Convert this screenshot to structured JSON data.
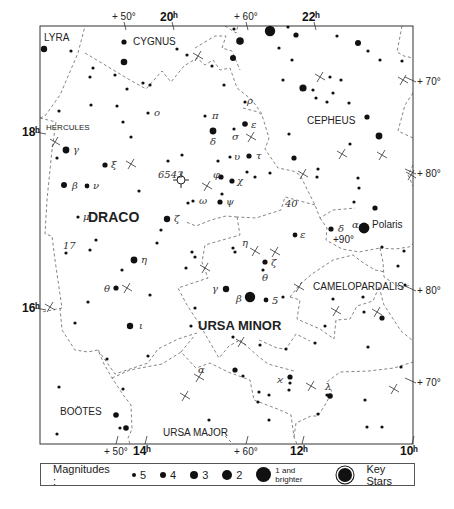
{
  "frame": {
    "x": 40,
    "y": 26,
    "w": 373,
    "h": 418
  },
  "constellations": [
    {
      "name": "LYRA",
      "x": 44,
      "y": 41,
      "size": 10
    },
    {
      "name": "CYGNUS",
      "x": 133,
      "y": 45,
      "size": 10
    },
    {
      "name": "HERCULES",
      "x": 46,
      "y": 130,
      "size": 8
    },
    {
      "name": "CEPHEUS",
      "x": 307,
      "y": 124,
      "size": 10
    },
    {
      "name": "DRACO",
      "x": 88,
      "y": 222,
      "size": 14,
      "bold": true
    },
    {
      "name": "URSA MINOR",
      "x": 198,
      "y": 330,
      "size": 13,
      "bold": true
    },
    {
      "name": "CAMELOPARDALIS",
      "x": 313,
      "y": 290,
      "size": 10
    },
    {
      "name": "BOÖTES",
      "x": 60,
      "y": 415,
      "size": 10
    },
    {
      "name": "URSA MAJOR",
      "x": 163,
      "y": 436,
      "size": 10
    }
  ],
  "coordinates": {
    "top": [
      {
        "label": "+ 50°",
        "x": 112,
        "y": 20,
        "bold": false
      },
      {
        "label": "20ʰ",
        "x": 160,
        "y": 21,
        "bold": true
      },
      {
        "label": "+ 60°",
        "x": 234,
        "y": 20,
        "bold": false
      },
      {
        "label": "22ʰ",
        "x": 302,
        "y": 21,
        "bold": true
      }
    ],
    "bottom": [
      {
        "label": "+ 50°",
        "x": 104,
        "y": 455,
        "bold": false
      },
      {
        "label": "14ʰ",
        "x": 133,
        "y": 455,
        "bold": true
      },
      {
        "label": "+ 60°",
        "x": 234,
        "y": 455,
        "bold": false
      },
      {
        "label": "12ʰ",
        "x": 290,
        "y": 455,
        "bold": true
      },
      {
        "label": "10ʰ",
        "x": 400,
        "y": 455,
        "bold": true
      }
    ],
    "left": [
      {
        "label": "18ʰ",
        "x": 22,
        "y": 136,
        "bold": true
      },
      {
        "label": "16ʰ",
        "x": 22,
        "y": 312,
        "bold": true
      }
    ],
    "right": [
      {
        "label": "+ 70°",
        "x": 417,
        "y": 85
      },
      {
        "label": "+ 80°",
        "x": 417,
        "y": 177
      },
      {
        "label": "+ 80°",
        "x": 417,
        "y": 294
      },
      {
        "label": "+ 70°",
        "x": 417,
        "y": 386
      }
    ]
  },
  "stars": [
    {
      "x": 44,
      "y": 49,
      "r": 3.2
    },
    {
      "x": 71,
      "y": 51,
      "r": 1.6
    },
    {
      "x": 124,
      "y": 42,
      "r": 2.6
    },
    {
      "x": 124,
      "y": 62,
      "r": 3.3
    },
    {
      "x": 93,
      "y": 68,
      "r": 1.6
    },
    {
      "x": 90,
      "y": 77,
      "r": 1.6
    },
    {
      "x": 115,
      "y": 75,
      "r": 1.6
    },
    {
      "x": 127,
      "y": 89,
      "r": 1.6
    },
    {
      "x": 143,
      "y": 83,
      "r": 1.6
    },
    {
      "x": 150,
      "y": 85,
      "r": 1.6
    },
    {
      "x": 177,
      "y": 49,
      "r": 1.6
    },
    {
      "x": 187,
      "y": 55,
      "r": 1.6
    },
    {
      "x": 212,
      "y": 66,
      "r": 1.6
    },
    {
      "x": 224,
      "y": 85,
      "r": 1.6
    },
    {
      "x": 59,
      "y": 111,
      "r": 1.6
    },
    {
      "x": 91,
      "y": 105,
      "r": 1.6
    },
    {
      "x": 117,
      "y": 106,
      "r": 1.6
    },
    {
      "x": 148,
      "y": 113,
      "r": 1.6
    },
    {
      "x": 123,
      "y": 122,
      "r": 1.6
    },
    {
      "x": 131,
      "y": 137,
      "r": 1.6
    },
    {
      "x": 240,
      "y": 41,
      "r": 3.8
    },
    {
      "x": 270,
      "y": 31,
      "r": 5.2
    },
    {
      "x": 233,
      "y": 58,
      "r": 3.0
    },
    {
      "x": 288,
      "y": 27,
      "r": 1.6
    },
    {
      "x": 296,
      "y": 35,
      "r": 2.6
    },
    {
      "x": 337,
      "y": 36,
      "r": 1.6
    },
    {
      "x": 279,
      "y": 48,
      "r": 1.6
    },
    {
      "x": 292,
      "y": 60,
      "r": 1.6
    },
    {
      "x": 358,
      "y": 43,
      "r": 3.0
    },
    {
      "x": 368,
      "y": 51,
      "r": 1.6
    },
    {
      "x": 380,
      "y": 60,
      "r": 1.6
    },
    {
      "x": 402,
      "y": 61,
      "r": 1.6
    },
    {
      "x": 283,
      "y": 80,
      "r": 1.6
    },
    {
      "x": 303,
      "y": 88,
      "r": 3.6
    },
    {
      "x": 330,
      "y": 77,
      "r": 1.6
    },
    {
      "x": 341,
      "y": 80,
      "r": 1.6
    },
    {
      "x": 313,
      "y": 90,
      "r": 1.6
    },
    {
      "x": 333,
      "y": 93,
      "r": 1.6
    },
    {
      "x": 316,
      "y": 98,
      "r": 1.6
    },
    {
      "x": 327,
      "y": 102,
      "r": 1.6
    },
    {
      "x": 349,
      "y": 103,
      "r": 1.6
    },
    {
      "x": 367,
      "y": 117,
      "r": 2.6
    },
    {
      "x": 379,
      "y": 136,
      "r": 3.4
    },
    {
      "x": 350,
      "y": 144,
      "r": 1.6
    },
    {
      "x": 289,
      "y": 134,
      "r": 1.6
    },
    {
      "x": 294,
      "y": 158,
      "r": 2.6
    },
    {
      "x": 318,
      "y": 169,
      "r": 1.6
    },
    {
      "x": 317,
      "y": 177,
      "r": 1.6
    },
    {
      "x": 358,
      "y": 178,
      "r": 1.6
    },
    {
      "x": 359,
      "y": 188,
      "r": 1.6
    },
    {
      "x": 354,
      "y": 202,
      "r": 1.6
    },
    {
      "x": 375,
      "y": 208,
      "r": 2.6
    },
    {
      "x": 234,
      "y": 29,
      "r": 1.6
    },
    {
      "x": 66,
      "y": 150,
      "r": 3.4
    },
    {
      "x": 57,
      "y": 158,
      "r": 1.6
    },
    {
      "x": 105,
      "y": 165,
      "r": 2.6
    },
    {
      "x": 64,
      "y": 185,
      "r": 3.0
    },
    {
      "x": 87,
      "y": 186,
      "r": 2.4
    },
    {
      "x": 78,
      "y": 217,
      "r": 1.6
    },
    {
      "x": 139,
      "y": 191,
      "r": 1.6
    },
    {
      "x": 167,
      "y": 219,
      "r": 3.2
    },
    {
      "x": 161,
      "y": 230,
      "r": 1.6
    },
    {
      "x": 96,
      "y": 240,
      "r": 1.6
    },
    {
      "x": 66,
      "y": 253,
      "r": 1.6
    },
    {
      "x": 90,
      "y": 250,
      "r": 1.6
    },
    {
      "x": 157,
      "y": 243,
      "r": 1.6
    },
    {
      "x": 168,
      "y": 161,
      "r": 1.6
    },
    {
      "x": 182,
      "y": 155,
      "r": 1.6
    },
    {
      "x": 188,
      "y": 203,
      "r": 1.6
    },
    {
      "x": 193,
      "y": 201,
      "r": 1.6
    },
    {
      "x": 213,
      "y": 131,
      "r": 3.4
    },
    {
      "x": 205,
      "y": 116,
      "r": 1.6
    },
    {
      "x": 245,
      "y": 102,
      "r": 1.6
    },
    {
      "x": 245,
      "y": 124,
      "r": 2.8
    },
    {
      "x": 234,
      "y": 129,
      "r": 1.6
    },
    {
      "x": 249,
      "y": 156,
      "r": 2.6
    },
    {
      "x": 230,
      "y": 157,
      "r": 1.6
    },
    {
      "x": 221,
      "y": 177,
      "r": 2.6
    },
    {
      "x": 232,
      "y": 181,
      "r": 2.6
    },
    {
      "x": 247,
      "y": 172,
      "r": 1.6
    },
    {
      "x": 255,
      "y": 177,
      "r": 1.6
    },
    {
      "x": 270,
      "y": 173,
      "r": 1.6
    },
    {
      "x": 222,
      "y": 194,
      "r": 1.6
    },
    {
      "x": 220,
      "y": 202,
      "r": 2.6
    },
    {
      "x": 218,
      "y": 161,
      "r": 1.6
    },
    {
      "x": 295,
      "y": 235,
      "r": 2.4
    },
    {
      "x": 331,
      "y": 229,
      "r": 2.6
    },
    {
      "x": 364,
      "y": 228,
      "r": 5.4
    },
    {
      "x": 382,
      "y": 247,
      "r": 1.6
    },
    {
      "x": 404,
      "y": 251,
      "r": 1.6
    },
    {
      "x": 398,
      "y": 266,
      "r": 1.6
    },
    {
      "x": 233,
      "y": 248,
      "r": 1.6
    },
    {
      "x": 235,
      "y": 252,
      "r": 1.6
    },
    {
      "x": 192,
      "y": 252,
      "r": 1.6
    },
    {
      "x": 195,
      "y": 257,
      "r": 1.6
    },
    {
      "x": 186,
      "y": 268,
      "r": 1.6
    },
    {
      "x": 265,
      "y": 262,
      "r": 2.6
    },
    {
      "x": 263,
      "y": 270,
      "r": 1.6
    },
    {
      "x": 134,
      "y": 260,
      "r": 3.4
    },
    {
      "x": 122,
      "y": 270,
      "r": 1.6
    },
    {
      "x": 116,
      "y": 288,
      "r": 2.6
    },
    {
      "x": 150,
      "y": 295,
      "r": 1.6
    },
    {
      "x": 88,
      "y": 302,
      "r": 1.6
    },
    {
      "x": 226,
      "y": 289,
      "r": 3.2
    },
    {
      "x": 250,
      "y": 297,
      "r": 5.2
    },
    {
      "x": 266,
      "y": 300,
      "r": 2.4
    },
    {
      "x": 283,
      "y": 297,
      "r": 1.6
    },
    {
      "x": 195,
      "y": 308,
      "r": 1.6
    },
    {
      "x": 191,
      "y": 326,
      "r": 1.6
    },
    {
      "x": 130,
      "y": 326,
      "r": 3.2
    },
    {
      "x": 75,
      "y": 323,
      "r": 1.6
    },
    {
      "x": 107,
      "y": 359,
      "r": 1.6
    },
    {
      "x": 148,
      "y": 356,
      "r": 1.6
    },
    {
      "x": 233,
      "y": 337,
      "r": 1.6
    },
    {
      "x": 260,
      "y": 345,
      "r": 1.6
    },
    {
      "x": 235,
      "y": 370,
      "r": 2.6
    },
    {
      "x": 243,
      "y": 376,
      "r": 1.6
    },
    {
      "x": 286,
      "y": 349,
      "r": 1.6
    },
    {
      "x": 333,
      "y": 299,
      "r": 1.6
    },
    {
      "x": 363,
      "y": 297,
      "r": 1.6
    },
    {
      "x": 364,
      "y": 312,
      "r": 1.6
    },
    {
      "x": 382,
      "y": 318,
      "r": 2.6
    },
    {
      "x": 405,
      "y": 285,
      "r": 1.6
    },
    {
      "x": 325,
      "y": 326,
      "r": 1.6
    },
    {
      "x": 315,
      "y": 343,
      "r": 1.6
    },
    {
      "x": 368,
      "y": 347,
      "r": 1.6
    },
    {
      "x": 401,
      "y": 367,
      "r": 1.6
    },
    {
      "x": 290,
      "y": 377,
      "r": 2.6
    },
    {
      "x": 290,
      "y": 383,
      "r": 1.6
    },
    {
      "x": 289,
      "y": 390,
      "r": 1.6
    },
    {
      "x": 259,
      "y": 392,
      "r": 1.6
    },
    {
      "x": 269,
      "y": 395,
      "r": 1.6
    },
    {
      "x": 258,
      "y": 402,
      "r": 1.6
    },
    {
      "x": 327,
      "y": 395,
      "r": 1.6
    },
    {
      "x": 330,
      "y": 396,
      "r": 2.8
    },
    {
      "x": 318,
      "y": 414,
      "r": 1.6
    },
    {
      "x": 365,
      "y": 400,
      "r": 1.6
    },
    {
      "x": 367,
      "y": 427,
      "r": 1.6
    },
    {
      "x": 382,
      "y": 427,
      "r": 1.6
    },
    {
      "x": 269,
      "y": 420,
      "r": 1.6
    },
    {
      "x": 209,
      "y": 420,
      "r": 1.6
    },
    {
      "x": 59,
      "y": 387,
      "r": 1.6
    },
    {
      "x": 116,
      "y": 415,
      "r": 2.8
    },
    {
      "x": 120,
      "y": 428,
      "r": 1.6
    },
    {
      "x": 126,
      "y": 428,
      "r": 2.8
    },
    {
      "x": 57,
      "y": 434,
      "r": 1.6
    },
    {
      "x": 123,
      "y": 389,
      "r": 1.6
    }
  ],
  "greek_labels": [
    {
      "t": "γ",
      "x": 73,
      "y": 153
    },
    {
      "t": "β",
      "x": 72,
      "y": 189
    },
    {
      "t": "ν",
      "x": 93,
      "y": 189
    },
    {
      "t": "ξ",
      "x": 111,
      "y": 168
    },
    {
      "t": "μ",
      "x": 83,
      "y": 220
    },
    {
      "t": "ζ",
      "x": 174,
      "y": 222
    },
    {
      "t": "η",
      "x": 141,
      "y": 263
    },
    {
      "t": "θ",
      "x": 104,
      "y": 292
    },
    {
      "t": "ι",
      "x": 139,
      "y": 329
    },
    {
      "t": "ο",
      "x": 154,
      "y": 116
    },
    {
      "t": "π",
      "x": 212,
      "y": 119
    },
    {
      "t": "δ",
      "x": 210,
      "y": 145
    },
    {
      "t": "ρ",
      "x": 247,
      "y": 104
    },
    {
      "t": "ε",
      "x": 251,
      "y": 128
    },
    {
      "t": "σ",
      "x": 232,
      "y": 140
    },
    {
      "t": "υ",
      "x": 234,
      "y": 160
    },
    {
      "t": "τ",
      "x": 256,
      "y": 159
    },
    {
      "t": "φ",
      "x": 213,
      "y": 178
    },
    {
      "t": "χ",
      "x": 237,
      "y": 184
    },
    {
      "t": "ω",
      "x": 199,
      "y": 204
    },
    {
      "t": "ψ",
      "x": 226,
      "y": 205
    },
    {
      "t": "η",
      "x": 242,
      "y": 246
    },
    {
      "t": "ζ",
      "x": 271,
      "y": 266
    },
    {
      "t": "θ",
      "x": 262,
      "y": 281
    },
    {
      "t": "ε",
      "x": 300,
      "y": 238
    },
    {
      "t": "γ",
      "x": 212,
      "y": 292
    },
    {
      "t": "β",
      "x": 236,
      "y": 302
    },
    {
      "t": "5",
      "x": 272,
      "y": 304
    },
    {
      "t": "δ",
      "x": 338,
      "y": 232
    },
    {
      "t": "α",
      "x": 352,
      "y": 228
    },
    {
      "t": "α",
      "x": 198,
      "y": 373
    },
    {
      "t": "ϰ",
      "x": 277,
      "y": 383
    },
    {
      "t": "λ",
      "x": 325,
      "y": 390
    },
    {
      "t": "17",
      "x": 63,
      "y": 249
    },
    {
      "t": "40",
      "x": 285,
      "y": 207
    },
    {
      "t": "6543",
      "x": 158,
      "y": 178
    }
  ],
  "special_labels": [
    {
      "t": "Polaris",
      "x": 372,
      "y": 228,
      "size": 10
    },
    {
      "t": "+90°",
      "x": 333,
      "y": 243,
      "size": 10
    }
  ],
  "nebula": {
    "x": 181,
    "y": 180,
    "r": 4,
    "label": "6543"
  },
  "crosses": [
    {
      "x": 55,
      "y": 142
    },
    {
      "x": 131,
      "y": 164
    },
    {
      "x": 207,
      "y": 186
    },
    {
      "x": 198,
      "y": 56
    },
    {
      "x": 251,
      "y": 137
    },
    {
      "x": 320,
      "y": 77
    },
    {
      "x": 342,
      "y": 154
    },
    {
      "x": 382,
      "y": 155
    },
    {
      "x": 403,
      "y": 80
    },
    {
      "x": 411,
      "y": 175
    },
    {
      "x": 303,
      "y": 174
    },
    {
      "x": 275,
      "y": 252
    },
    {
      "x": 205,
      "y": 268
    },
    {
      "x": 127,
      "y": 288
    },
    {
      "x": 50,
      "y": 307
    },
    {
      "x": 299,
      "y": 287
    },
    {
      "x": 336,
      "y": 311
    },
    {
      "x": 377,
      "y": 312
    },
    {
      "x": 199,
      "y": 377
    },
    {
      "x": 241,
      "y": 342
    },
    {
      "x": 185,
      "y": 396
    },
    {
      "x": 311,
      "y": 386
    },
    {
      "x": 394,
      "y": 389
    },
    {
      "x": 255,
      "y": 251
    }
  ],
  "boundaries": [
    "M40,118 L45,116 L60,95 L78,53 L85,26",
    "M40,118 L56,122 L52,150 L47,200 L45,234 L52,236 L55,260 L62,308 L42,312",
    "M85,53 L130,80 L146,89 L162,71 L171,82 L184,66 L197,58 L205,65 L213,60 L220,70 L230,68 L237,88 L252,100 L262,114",
    "M225,26 L236,33 L238,26",
    "M195,48 L215,36 L226,36 L222,48 L232,51 L240,70",
    "M243,108 L258,112 L262,115 L269,138 L265,149 L278,168 L293,171 L300,175 L303,181 L315,205 L320,218 L333,210 L345,209 L355,208",
    "M320,218 L327,228 L326,240 L342,249 L359,252 L380,248",
    "M315,205 L300,201 L285,197 L281,210 L256,218 L237,217",
    "M237,217 L240,235 L205,245 L202,262 L208,278 L178,288 L187,305 L200,325 L212,346 L219,358 L229,346 L240,340",
    "M237,217 L226,216 L211,220 L196,226 L186,222",
    "M60,308 L62,330 L75,350 L88,352 L98,350 L104,364 L112,378 L124,396 L131,405 L132,429 L128,438 L130,444",
    "M98,350 L115,374 L148,363 L158,349 L178,339 L197,333",
    "M380,248 L395,249 L409,247 L413,244",
    "M380,248 L383,262 L384,277 L401,288 L410,285",
    "M290,297 L300,284 L312,274 L333,260 L353,255 L362,262 L375,270 L385,272",
    "M290,297 L300,300 L297,319 L320,329 L334,339 L336,320 L350,319 L357,306 L373,301 L379,287",
    "M379,287 L384,305 L401,331 L412,340",
    "M259,340 L277,348 L286,349 L296,334 L310,341",
    "M240,340 L259,357 L268,364 L294,371",
    "M112,378 L130,370 L162,364 L181,352 L196,368 L210,363 L228,372 L250,380 L254,400 L280,410 L291,415 L294,437 L297,444",
    "M181,352 L195,335",
    "M294,437 L296,423 L311,416 L318,416 L325,405 L332,392 L327,382 L340,372 L369,371 L394,368 L413,362",
    "M225,436 L233,444",
    "M402,26 L397,52 L404,56 L413,58",
    "M413,93 L405,105 L398,131 L413,138",
    "M413,165 L408,175 L413,186"
  ],
  "legend": {
    "title": "Magnitudes :",
    "items": [
      {
        "label": "5",
        "size": 4
      },
      {
        "label": "4",
        "size": 6
      },
      {
        "label": "3",
        "size": 8
      },
      {
        "label": "2",
        "size": 10
      },
      {
        "label": "1 and brighter",
        "size": 15,
        "small": true
      }
    ],
    "key_stars_label": "Key Stars"
  }
}
